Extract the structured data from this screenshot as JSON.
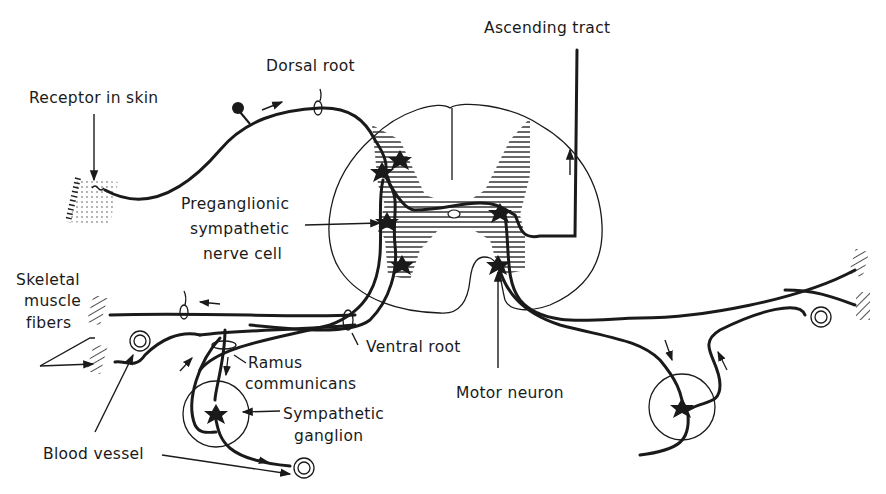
{
  "figure": {
    "labels": {
      "receptor_in_skin": "Receptor in skin",
      "dorsal_root": "Dorsal root",
      "ascending_tract": "Ascending tract",
      "preganglionic_1": "Preganglionic",
      "preganglionic_2": "sympathetic",
      "preganglionic_3": "nerve cell",
      "skeletal_1": "Skeletal",
      "skeletal_2": "muscle",
      "skeletal_3": "fibers",
      "ramus_1": "Ramus",
      "ramus_2": "communicans",
      "ventral_root": "Ventral root",
      "motor_neuron": "Motor neuron",
      "sympathetic_1": "Sympathetic",
      "sympathetic_2": "ganglion",
      "blood_vessel": "Blood vessel"
    },
    "colors": {
      "ink": "#1a1a1a",
      "background": "#ffffff"
    }
  }
}
